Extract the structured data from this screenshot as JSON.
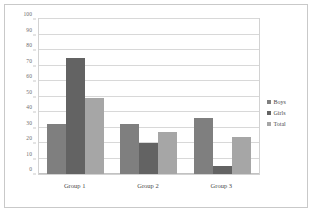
{
  "chart_data": {
    "type": "bar",
    "title": "",
    "subtitle": "",
    "xlabel": "",
    "ylabel": "",
    "categories": [
      "Group 1",
      "Group 2",
      "Group 3"
    ],
    "series": [
      {
        "name": "Boys",
        "values": [
          32,
          32,
          36
        ],
        "color": "#7f7f7f"
      },
      {
        "name": "Girls",
        "values": [
          75,
          20,
          5
        ],
        "color": "#636363"
      },
      {
        "name": "Total",
        "values": [
          49,
          27,
          24
        ],
        "color": "#a6a6a6"
      }
    ],
    "ylim": [
      0,
      100
    ],
    "ytick_values": [
      0,
      10,
      20,
      30,
      40,
      50,
      60,
      70,
      80,
      90,
      100
    ],
    "ytick_labels": [
      "0",
      "10",
      "20",
      "30",
      "40",
      "50",
      "60",
      "70",
      "80",
      "90",
      "100"
    ],
    "grid": true,
    "grid_axis": "y",
    "legend": true,
    "legend_position": "right",
    "legend_entries": [
      "Boys",
      "Girls",
      "Total"
    ],
    "bar_mode": "grouped",
    "grid_color": "#d8d8d8",
    "plot_border_color": "#d2d2d2",
    "figure_border_color": "#c9c9c9",
    "background_color": "#ffffff",
    "axis_text_color": "#6d6d6d"
  }
}
